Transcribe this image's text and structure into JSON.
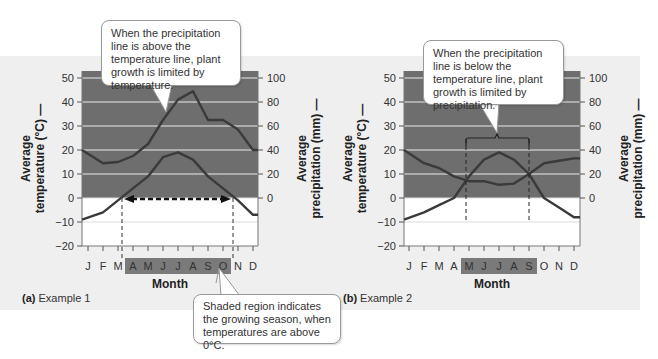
{
  "chart_data": [
    {
      "type": "line",
      "title": "Example 1",
      "panel_label": "(a)",
      "xlabel": "Month",
      "ylabel_left": "Average temperature (°C)",
      "ylabel_right": "Average precipitation (mm)",
      "categories": [
        "J",
        "F",
        "M",
        "A",
        "M",
        "J",
        "J",
        "A",
        "S",
        "O",
        "N",
        "D"
      ],
      "ylim_left": [
        -20,
        50
      ],
      "yticks_left": [
        -20,
        -10,
        0,
        10,
        20,
        30,
        40,
        50
      ],
      "ylim_right": [
        0,
        100
      ],
      "yticks_right": [
        0,
        20,
        40,
        60,
        80,
        100
      ],
      "grid": true,
      "series": [
        {
          "name": "Average temperature (°C)",
          "axis": "left",
          "values": [
            -9,
            -6,
            -1,
            4,
            9,
            17,
            19,
            16,
            9,
            4,
            -1,
            -7
          ]
        },
        {
          "name": "Average precipitation (mm)",
          "axis": "right",
          "values": [
            40,
            29,
            30,
            35,
            45,
            65,
            82,
            89,
            65,
            65,
            57,
            40
          ]
        }
      ],
      "growing_season_months": [
        "A",
        "M",
        "J",
        "J",
        "A",
        "S",
        "O"
      ],
      "annotations": [
        "Dashed double arrow along 0°C between the temperature crossings marking the growing season"
      ]
    },
    {
      "type": "line",
      "title": "Example 2",
      "panel_label": "(b)",
      "xlabel": "Month",
      "ylabel_left": "Average temperature (°C)",
      "ylabel_right": "Average precipitation (mm)",
      "categories": [
        "J",
        "F",
        "M",
        "A",
        "M",
        "J",
        "J",
        "A",
        "S",
        "O",
        "N",
        "D"
      ],
      "ylim_left": [
        -20,
        50
      ],
      "yticks_left": [
        -20,
        -10,
        0,
        10,
        20,
        30,
        40,
        50
      ],
      "ylim_right": [
        0,
        100
      ],
      "yticks_right": [
        0,
        20,
        40,
        60,
        80,
        100
      ],
      "grid": true,
      "series": [
        {
          "name": "Average temperature (°C)",
          "axis": "left",
          "values": [
            -9,
            -6,
            -3,
            0,
            9,
            16,
            19,
            16,
            10,
            0,
            -4,
            -8
          ]
        },
        {
          "name": "Average precipitation (mm)",
          "axis": "right",
          "values": [
            40,
            29,
            25,
            18,
            14,
            14,
            11,
            12,
            20,
            29,
            31,
            33
          ]
        }
      ],
      "growing_season_months": [
        "M",
        "J",
        "J",
        "A",
        "S"
      ],
      "annotations": [
        "Bracket over May–September where precipitation is below temperature"
      ]
    }
  ],
  "captions": {
    "a_label": "(a)",
    "a_text": " Example 1",
    "b_label": "(b)",
    "b_text": " Example 2"
  },
  "callouts": {
    "a": "When the precipitation line is above the temperature line, plant growth is limited by temperature.",
    "b": "When the precipitation line is below the temperature line, plant growth is limited by precipitation.",
    "season": "Shaded region indicates the growing season, when temperatures are above 0°C."
  },
  "labels": {
    "month": "Month",
    "temp_line1": "Average",
    "temp_line2": "temperature (°C) —",
    "precip_line1": "Average",
    "precip_line2": "precipitation (mm) —"
  },
  "colors": {
    "panel_bg": "#efefef",
    "plot_shade": "#6e6e6e",
    "plot_white": "#ffffff",
    "gridline": "#e6e6e6",
    "line": "#3a3a3a",
    "season_band": "#7a7a7a"
  }
}
